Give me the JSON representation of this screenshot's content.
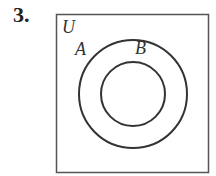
{
  "problem": {
    "number": "3."
  },
  "venn": {
    "universe_label": "U",
    "outer_set_label": "A",
    "inner_set_label": "B",
    "relationship": "B is a subset of A (concentric circles)",
    "colors": {
      "stroke": "#333333",
      "frame": "#555555",
      "background": "#ffffff"
    }
  }
}
